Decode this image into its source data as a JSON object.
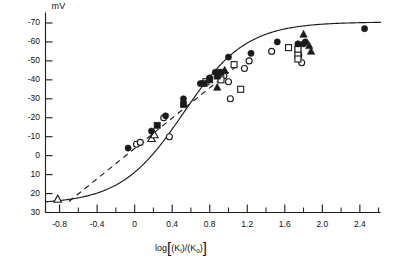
{
  "chart_data": {
    "type": "scatter",
    "title": "",
    "subtitle": "",
    "xlabel": "log[(Ki)/(Ko)]",
    "ylabel": "mV",
    "ylabel_unit": "mV",
    "xlim": [
      -0.95,
      2.62
    ],
    "ylim_top": -75,
    "ylim_bottom": 30,
    "ylim": [
      30,
      -75
    ],
    "grid": false,
    "legend_position": "none",
    "y_ticks": [
      -70,
      -60,
      -50,
      -40,
      -30,
      -20,
      -10,
      0,
      10,
      20,
      30
    ],
    "y_tick_labels": [
      "-70",
      "-60",
      "-50",
      "-40",
      "-30",
      "-20",
      "-10",
      "0",
      "10",
      "20",
      "30"
    ],
    "x_ticks": [
      -0.8,
      -0.4,
      0,
      0.4,
      0.8,
      1.2,
      1.6,
      2.0,
      2.4
    ],
    "x_tick_labels": [
      "-0.8",
      "-0.4",
      "0",
      "0.4",
      "0.8",
      "1.2",
      "1.6",
      "2.0",
      "2.4"
    ],
    "x_minor_ticks": [
      -0.6,
      -0.2,
      0.2,
      0.6,
      1.0,
      1.4,
      1.8,
      2.2,
      2.6
    ],
    "axis_color": "#1a1a1a",
    "marker_color": "#1a1a1a",
    "curve_color": "#1a1a1a",
    "series": [
      {
        "name": "filled-circle",
        "marker": "filled-circle",
        "points": [
          [
            -0.07,
            -4
          ],
          [
            0.18,
            -13
          ],
          [
            0.33,
            -21
          ],
          [
            0.52,
            -30
          ],
          [
            0.7,
            -38
          ],
          [
            0.8,
            -41
          ],
          [
            0.86,
            -44
          ],
          [
            1.0,
            -52
          ],
          [
            1.24,
            -54
          ],
          [
            1.52,
            -60
          ],
          [
            1.74,
            -59
          ],
          [
            1.8,
            -59
          ],
          [
            1.82,
            -60
          ],
          [
            2.45,
            -67
          ]
        ]
      },
      {
        "name": "filled-square",
        "marker": "filled-square",
        "points": [
          [
            0.24,
            -16
          ],
          [
            0.52,
            -27
          ],
          [
            0.74,
            -38
          ],
          [
            0.8,
            -40
          ],
          [
            0.88,
            -42
          ],
          [
            0.92,
            -44
          ]
        ]
      },
      {
        "name": "open-square",
        "marker": "open-square",
        "points": [
          [
            0.76,
            -39
          ],
          [
            0.92,
            -40
          ],
          [
            1.06,
            -48
          ],
          [
            1.13,
            -35
          ],
          [
            1.64,
            -57
          ],
          [
            1.74,
            -56
          ],
          [
            1.74,
            -53
          ],
          [
            1.74,
            -51
          ]
        ]
      },
      {
        "name": "open-circle",
        "marker": "open-circle",
        "points": [
          [
            0.02,
            -6
          ],
          [
            0.06,
            -7
          ],
          [
            0.31,
            -20
          ],
          [
            0.37,
            -10
          ],
          [
            0.95,
            -42
          ],
          [
            1.0,
            -39
          ],
          [
            1.02,
            -30
          ],
          [
            1.17,
            -46
          ],
          [
            1.22,
            -50
          ],
          [
            1.46,
            -55
          ],
          [
            1.74,
            -57
          ],
          [
            1.74,
            -55
          ],
          [
            1.75,
            -53
          ],
          [
            1.78,
            -49
          ]
        ]
      },
      {
        "name": "filled-triangle",
        "marker": "filled-triangle",
        "points": [
          [
            0.88,
            -36
          ],
          [
            0.96,
            -45
          ],
          [
            1.8,
            -64
          ],
          [
            1.86,
            -58
          ],
          [
            1.88,
            -55
          ]
        ]
      },
      {
        "name": "open-triangle",
        "marker": "open-triangle",
        "points": [
          [
            -0.82,
            23
          ],
          [
            0.18,
            -9
          ],
          [
            0.21,
            -11
          ]
        ]
      }
    ],
    "annotations": [
      {
        "name": "sigmoid-fit-curve",
        "style": "solid",
        "description": "sigmoidal best-fit curve"
      },
      {
        "name": "nernst-slope-line",
        "style": "dashed",
        "description": "dashed straight line of Nernstian slope"
      }
    ]
  }
}
